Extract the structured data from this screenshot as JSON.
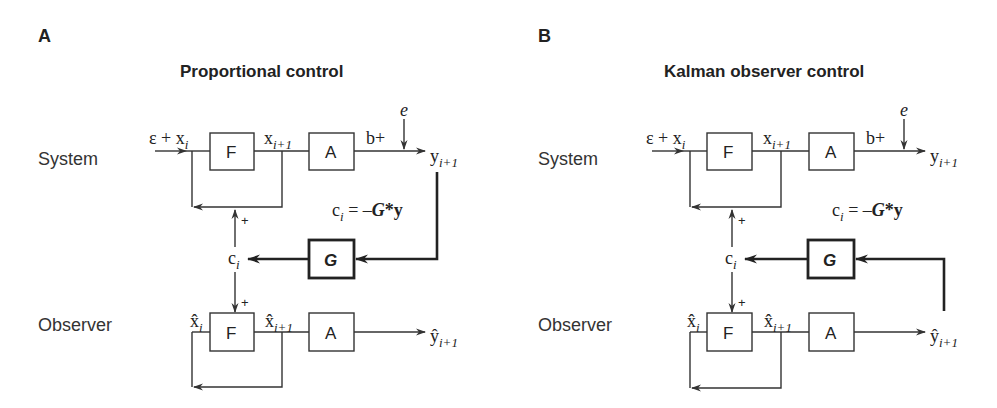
{
  "figure": {
    "panels": [
      {
        "letter": "A",
        "title": "Proportional control",
        "rows": {
          "system": "System",
          "observer": "Observer"
        },
        "blocks": {
          "f": "F",
          "a": "A",
          "g": "G"
        },
        "signals": {
          "input_eps": "ε + x",
          "input_sub": "i",
          "x_next": "x",
          "x_next_sub": "i+1",
          "b_plus": "b+",
          "noise": "e",
          "y_next": "y",
          "y_next_sub": "i+1",
          "control": "c",
          "control_sub": "i",
          "plus_top": "+",
          "plus_bottom": "+",
          "xhat": "x̂",
          "xhat_sub": "i",
          "xhat_next": "x̂",
          "xhat_next_sub": "i+1",
          "yhat_next": "ŷ",
          "yhat_next_sub": "i+1",
          "law_c": "c",
          "law_sub": "i",
          "law_eq": " = –",
          "law_g": "G",
          "law_star": "*",
          "law_y": "y"
        },
        "feedback_source": "system output y(i+1)"
      },
      {
        "letter": "B",
        "title": "Kalman observer control",
        "rows": {
          "system": "System",
          "observer": "Observer"
        },
        "blocks": {
          "f": "F",
          "a": "A",
          "g": "G"
        },
        "signals": {
          "input_eps": "ε + x",
          "input_sub": "i",
          "x_next": "x",
          "x_next_sub": "i+1",
          "b_plus": "b+",
          "noise": "e",
          "y_next": "y",
          "y_next_sub": "i+1",
          "control": "c",
          "control_sub": "i",
          "plus_top": "+",
          "plus_bottom": "+",
          "xhat": "x̂",
          "xhat_sub": "i",
          "xhat_next": "x̂",
          "xhat_next_sub": "i+1",
          "yhat_next": "ŷ",
          "yhat_next_sub": "i+1",
          "law_c": "c",
          "law_sub": "i",
          "law_eq": " = –",
          "law_g": "G",
          "law_star": "*",
          "law_y": "y"
        },
        "feedback_source": "observer output ŷ(i+1)"
      }
    ]
  }
}
